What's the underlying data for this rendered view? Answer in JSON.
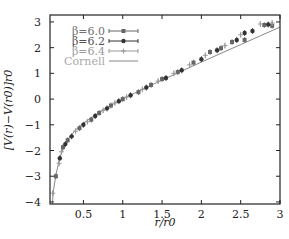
{
  "chart_data": {
    "type": "scatter",
    "title": "",
    "xlabel": "r/r0",
    "ylabel": "[V(r)−V(r0)]r0",
    "xlim": [
      0.075,
      3.0
    ],
    "ylim": [
      -4.08,
      3.27
    ],
    "xticks": [
      0.5,
      1,
      1.5,
      2,
      2.5,
      3
    ],
    "xtick_labels": [
      "0.5",
      "1",
      "1.5",
      "2",
      "2.5",
      "3"
    ],
    "yticks": [
      -4,
      -3,
      -2,
      -1,
      0,
      1,
      2,
      3
    ],
    "ytick_labels": [
      "−4",
      "−3",
      "−2",
      "−1",
      "0",
      "1",
      "2",
      "3"
    ],
    "grid": false,
    "legend_position": "upper left",
    "series": [
      {
        "name": "β=6.0",
        "marker": "square",
        "color": "#666666",
        "x": [
          0.15,
          0.24,
          0.3,
          0.45,
          0.6,
          0.7,
          0.85,
          1.0,
          1.2,
          1.36,
          1.5,
          1.7,
          1.9,
          2.11,
          2.25,
          2.39,
          2.55,
          2.8,
          2.9
        ],
        "y": [
          -3.0,
          -1.87,
          -1.6,
          -1.13,
          -0.8,
          -0.54,
          -0.25,
          0.0,
          0.27,
          0.55,
          0.78,
          1.05,
          1.42,
          1.83,
          1.98,
          2.22,
          2.3,
          2.88,
          2.85
        ]
      },
      {
        "name": "β=6.2",
        "marker": "circle",
        "color": "#333333",
        "x": [
          0.2,
          0.27,
          0.35,
          0.5,
          0.65,
          0.8,
          0.95,
          1.1,
          1.3,
          1.55,
          1.75,
          2.0,
          2.2,
          2.45,
          2.55,
          2.65,
          2.85
        ],
        "y": [
          -2.3,
          -1.75,
          -1.45,
          -1.0,
          -0.66,
          -0.36,
          -0.08,
          0.15,
          0.45,
          0.82,
          1.12,
          1.55,
          1.9,
          2.3,
          2.57,
          2.65,
          2.9
        ]
      },
      {
        "name": "β=6.4",
        "marker": "cross",
        "color": "#999999",
        "x": [
          0.11,
          0.19,
          0.22,
          0.4,
          0.55,
          0.75,
          0.9,
          1.05,
          1.25,
          1.45,
          1.65,
          1.85,
          2.05,
          2.3,
          2.5,
          2.75,
          2.9
        ],
        "y": [
          -3.66,
          -2.5,
          -2.05,
          -1.25,
          -0.88,
          -0.44,
          -0.15,
          0.08,
          0.38,
          0.7,
          1.0,
          1.33,
          1.7,
          2.08,
          2.5,
          2.92,
          2.96
        ]
      },
      {
        "name": "Cornell",
        "marker": "line",
        "color": "#888888",
        "x": [
          0.1,
          0.12,
          0.15,
          0.2,
          0.25,
          0.3,
          0.4,
          0.5,
          0.6,
          0.7,
          0.8,
          0.9,
          1.0,
          1.25,
          1.5,
          1.75,
          2.0,
          2.25,
          2.5,
          2.75,
          3.0
        ],
        "y": [
          -4.2,
          -3.55,
          -2.95,
          -2.28,
          -1.86,
          -1.58,
          -1.2,
          -0.94,
          -0.72,
          -0.52,
          -0.33,
          -0.16,
          0.0,
          0.38,
          0.74,
          1.09,
          1.44,
          1.78,
          2.12,
          2.46,
          2.8
        ]
      }
    ]
  },
  "legend": {
    "items": [
      {
        "label": "β=6.0",
        "color": "#707070"
      },
      {
        "label": "β=6.2",
        "color": "#505050"
      },
      {
        "label": "β=6.4",
        "color": "#9a9a9a"
      },
      {
        "label": "Cornell",
        "color": "#a8a8a8"
      }
    ]
  }
}
